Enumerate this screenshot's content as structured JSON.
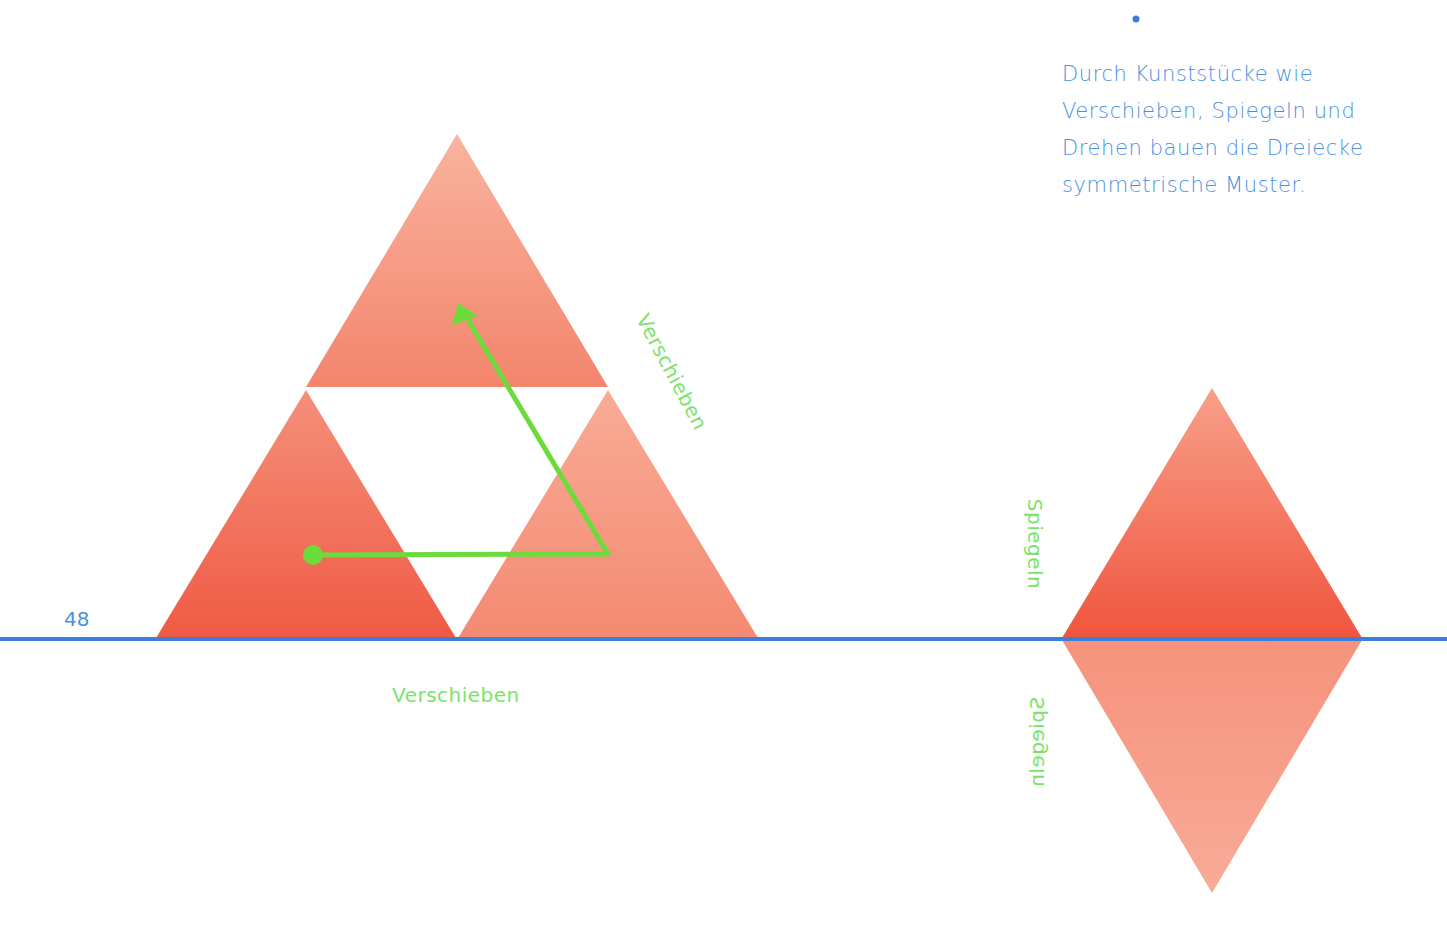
{
  "page": {
    "number": "48",
    "caption_lines": [
      "Durch Kunststücke wie",
      "Verschieben, Spiegeln und",
      "Drehen bauen die Dreiecke",
      "symmetrische Muster."
    ]
  },
  "labels": {
    "translate_bottom": "Verschieben",
    "translate_diagonal": "Verschieben",
    "mirror_upper": "Spiegeln",
    "mirror_lower": "Spiegeln"
  },
  "colors": {
    "triangle_dark": "#f2624a",
    "triangle_light": "#f7a08c",
    "baseline_blue": "#3a7fd8",
    "arrow_green": "#6bdc3c",
    "text_blue": "#4a90e2",
    "label_green": "#7be36a"
  }
}
